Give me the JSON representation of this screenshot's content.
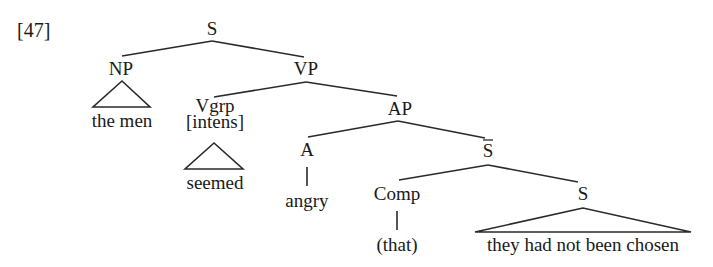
{
  "example_number": "[47]",
  "tree": {
    "root": "S",
    "np": {
      "label": "NP",
      "terminal": "the men"
    },
    "vp": {
      "label": "VP"
    },
    "vgrp": {
      "label": "Vgrp",
      "feature": "[intens]",
      "terminal": "seemed"
    },
    "ap": {
      "label": "AP"
    },
    "a": {
      "label": "A",
      "terminal": "angry"
    },
    "sbar": {
      "label": "S",
      "bar": true
    },
    "comp": {
      "label": "Comp",
      "terminal": "(that)"
    },
    "s_embedded": {
      "label": "S",
      "terminal": "they had not been chosen"
    }
  },
  "structure": {
    "S": [
      "NP",
      "VP"
    ],
    "NP": [
      "the men (triangle)"
    ],
    "VP": [
      "Vgrp [intens]",
      "AP"
    ],
    "Vgrp": [
      "seemed (triangle)"
    ],
    "AP": [
      "A",
      "S-bar"
    ],
    "A": [
      "angry"
    ],
    "S-bar": [
      "Comp",
      "S"
    ],
    "Comp": [
      "(that)"
    ],
    "S_embedded": [
      "they had not been chosen (triangle)"
    ]
  }
}
